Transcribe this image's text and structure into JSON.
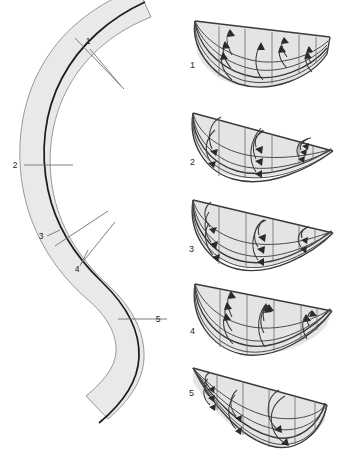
{
  "figure": {
    "background_color": "#ffffff",
    "width": 347,
    "height": 460
  },
  "plan_view": {
    "name": "meander-plan-view",
    "band_fill_color": "#e9e9e9",
    "band_outline_color": "#8d8d8d",
    "thalweg_color": "#1c1c1c",
    "tick_color": "#6f6f6f",
    "description": "Sinuous S-shaped channel belt with centre thalweg line and five numbered cross-section markers",
    "section_markers": [
      {
        "id": "1",
        "label": "1",
        "label_x": 88,
        "label_y": 45,
        "leader": "M 90 49 L 121 84"
      },
      {
        "id": "2",
        "label": "2",
        "label_x": 15,
        "label_y": 168,
        "leader": ""
      },
      {
        "id": "3",
        "label": "3",
        "label_x": 41,
        "label_y": 239,
        "leader": "M 47 236 L 57 231"
      },
      {
        "id": "4",
        "label": "4",
        "label_x": 77,
        "label_y": 270,
        "leader": "M 80 266 L 86 254"
      },
      {
        "id": "5",
        "label": "5",
        "label_x": 157,
        "label_y": 322,
        "leader": ""
      }
    ]
  },
  "cross_sections": {
    "name": "cross-section-panels",
    "fill_color": "#e4e4e4",
    "outline_color": "#3a3a3a",
    "grid_color": "#6a6a6a",
    "arrow_color": "#2b2b2b",
    "count": 5,
    "items": [
      {
        "label": "1",
        "label_x": 190,
        "label_y": 65,
        "caption": "Section 1 — near-symmetric bowl, secondary flow cells directed toward left bank",
        "deep_side": "centre",
        "arrow_count": 8
      },
      {
        "label": "2",
        "label_x": 188,
        "label_y": 163,
        "caption": "Section 2 — asymmetric, deepest near left bank, large circulation cell at left",
        "deep_side": "left",
        "arrow_count": 8
      },
      {
        "label": "3",
        "label_x": 186,
        "label_y": 249,
        "caption": "Section 3 — deep left pool with strong inward surface arrow",
        "deep_side": "left",
        "arrow_count": 8
      },
      {
        "label": "4",
        "label_x": 190,
        "label_y": 330,
        "caption": "Section 4 — broad bowl, paired secondary cells across width",
        "deep_side": "centre",
        "arrow_count": 8
      },
      {
        "label": "5",
        "label_x": 186,
        "label_y": 388,
        "caption": "Section 5 — strongly asymmetric, deepest at right bank with large vortex",
        "deep_side": "right",
        "arrow_count": 8
      }
    ]
  }
}
